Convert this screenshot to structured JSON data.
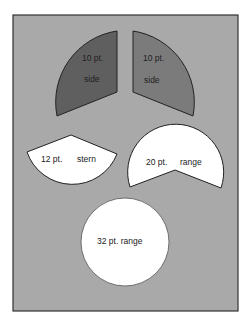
{
  "colors": {
    "page": "#ffffff",
    "panel": "#a9a9a9",
    "frame": "#333333",
    "left_side": "#5f5f5f",
    "right_side": "#7b7b7b",
    "white_shape": "#ffffff"
  },
  "shapes": [
    {
      "id": "left-side",
      "label_line1": "10 pt.",
      "label_line2": "side"
    },
    {
      "id": "right-side",
      "label_line1": "10 pt.",
      "label_line2": "side"
    },
    {
      "id": "stern",
      "label_size": "12 pt.",
      "label_type": "stern"
    },
    {
      "id": "range-20",
      "label_size": "20 pt.",
      "label_type": "range"
    },
    {
      "id": "range-32",
      "label": "32 pt. range"
    }
  ]
}
